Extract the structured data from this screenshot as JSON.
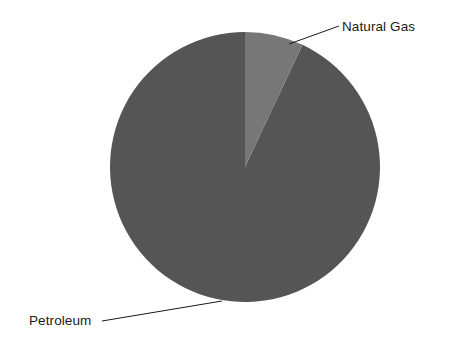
{
  "chart_data": {
    "type": "pie",
    "title": "",
    "categories": [
      "Petroleum",
      "Natural Gas"
    ],
    "values": [
      93,
      7
    ],
    "units": "percent",
    "labels": [
      {
        "name": "Petroleum",
        "text": "Petroleum",
        "value": 93,
        "color": "#555555",
        "leader": "bottom-left"
      },
      {
        "name": "Natural Gas",
        "text": "Natural Gas",
        "value": 7,
        "color": "#777777",
        "leader": "top-right"
      }
    ],
    "legend": "none",
    "grid": false,
    "start_angle_deg": 0,
    "direction": "clockwise",
    "background": "#ffffff"
  },
  "figure": {
    "background_color": "#ffffff",
    "text_color": "#1a1a1a",
    "center_x": 245,
    "center_y": 167,
    "radius": 135
  },
  "slices": {
    "petroleum": {
      "label": "Petroleum",
      "color": "#555555",
      "share_percent": 93
    },
    "natural_gas": {
      "label": "Natural Gas",
      "color": "#777777",
      "share_percent": 7
    }
  },
  "annotations": {
    "natural_gas_label": "Natural Gas",
    "petroleum_label": "Petroleum"
  }
}
